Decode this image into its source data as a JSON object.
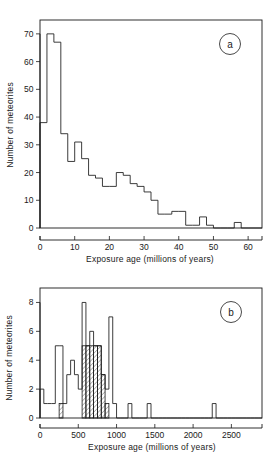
{
  "figure": {
    "panel_a_label": "a",
    "panel_b_label": "b"
  },
  "chart_data": [
    {
      "id": "panel-a",
      "type": "bar",
      "title": "",
      "panel_label": "a",
      "xlabel": "Exposure age (millions of years)",
      "ylabel": "Number of meteorites",
      "xlim": [
        0,
        64
      ],
      "ylim": [
        0,
        75
      ],
      "xticks": [
        0,
        10,
        20,
        30,
        40,
        50,
        60
      ],
      "xtick_labels": [
        "0",
        "10",
        "20",
        "30",
        "40",
        "50",
        "60"
      ],
      "yticks": [
        0,
        10,
        20,
        30,
        40,
        50,
        60,
        70
      ],
      "ytick_labels": [
        "0",
        "10",
        "20",
        "30",
        "40",
        "50",
        "60",
        "70"
      ],
      "grid": false,
      "legend": "none",
      "bin_width": 2,
      "bin_edges": [
        0,
        2,
        4,
        6,
        8,
        10,
        12,
        14,
        16,
        18,
        20,
        22,
        24,
        26,
        28,
        30,
        32,
        34,
        36,
        38,
        40,
        42,
        44,
        46,
        48,
        50,
        52,
        54,
        56,
        58,
        60,
        62,
        64
      ],
      "values": [
        38,
        70,
        67,
        34,
        24,
        31,
        25,
        19,
        18,
        15,
        15,
        20,
        19,
        16,
        15,
        13,
        10,
        5,
        5,
        6,
        6,
        1,
        1,
        4,
        1,
        0,
        0,
        0,
        2,
        0,
        0,
        0
      ]
    },
    {
      "id": "panel-b",
      "type": "bar",
      "title": "",
      "panel_label": "b",
      "xlabel": "Exposure age (millions of years)",
      "ylabel": "Number of meteorites",
      "xlim": [
        0,
        2900
      ],
      "ylim": [
        0,
        9
      ],
      "xticks": [
        0,
        500,
        1000,
        1500,
        2000,
        2500
      ],
      "xtick_labels": [
        "0",
        "500",
        "1000",
        "1500",
        "2000",
        "2500"
      ],
      "yticks": [
        0,
        2,
        4,
        6,
        8
      ],
      "ytick_labels": [
        "0",
        "2",
        "4",
        "6",
        "8"
      ],
      "grid": false,
      "legend": "none",
      "bin_width": 50,
      "bin_edges": [
        0,
        50,
        100,
        150,
        200,
        250,
        300,
        350,
        400,
        450,
        500,
        550,
        600,
        650,
        700,
        750,
        800,
        850,
        900,
        950,
        1000,
        1050,
        1100,
        1150,
        1200,
        1250,
        1300,
        1350,
        1400,
        1450,
        1500,
        1550,
        1600,
        1650,
        1700,
        1750,
        1800,
        1850,
        1900,
        1950,
        2000,
        2050,
        2100,
        2150,
        2200,
        2250,
        2300,
        2350,
        2400,
        2450,
        2500,
        2550,
        2600,
        2650,
        2700,
        2750,
        2800,
        2850,
        2900
      ],
      "values": [
        2,
        1,
        1,
        1,
        5,
        5,
        1,
        3,
        4,
        3,
        2,
        8,
        5,
        6,
        5,
        5,
        3,
        2,
        7,
        1,
        0,
        0,
        0,
        1,
        0,
        0,
        0,
        0,
        1,
        0,
        0,
        0,
        0,
        0,
        0,
        0,
        0,
        0,
        0,
        0,
        0,
        0,
        0,
        0,
        0,
        1,
        0,
        0,
        0,
        0,
        0,
        0,
        0,
        0,
        0,
        0,
        0,
        0
      ],
      "hatched_series": {
        "name": "hatched subset",
        "values": [
          0,
          0,
          0,
          0,
          0,
          1,
          0,
          0,
          0,
          0,
          0,
          5,
          5,
          5,
          5,
          5,
          3,
          1,
          0,
          0,
          0,
          0,
          0,
          0,
          0,
          0,
          0,
          0,
          0,
          0,
          0,
          0,
          0,
          0,
          0,
          0,
          0,
          0,
          0,
          0,
          0,
          0,
          0,
          0,
          0,
          0,
          0,
          0,
          0,
          0,
          0,
          0,
          0,
          0,
          0,
          0,
          0,
          0
        ]
      }
    }
  ]
}
